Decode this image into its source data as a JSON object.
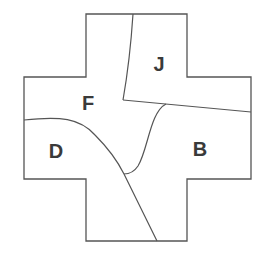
{
  "diagram": {
    "type": "map-regions",
    "shape": "cross",
    "stroke_color": "#555555",
    "label_color": "#3a3a3a",
    "regions": [
      {
        "id": "J",
        "label": "J",
        "x": 159,
        "y": 64
      },
      {
        "id": "F",
        "label": "F",
        "x": 88,
        "y": 103
      },
      {
        "id": "D",
        "label": "D",
        "x": 56,
        "y": 151
      },
      {
        "id": "B",
        "label": "B",
        "x": 200,
        "y": 149
      }
    ]
  }
}
